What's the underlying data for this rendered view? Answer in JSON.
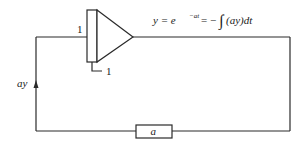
{
  "diagram": {
    "type": "analog-computer block diagram",
    "integrator": {
      "input_gain_label": "1",
      "initial_condition_label": "1"
    },
    "equation": {
      "lhs": "y = e",
      "exponent": "−at",
      "rhs_prefix": " = −",
      "integral_sign": "∫",
      "rhs_body": "(ay)dt"
    },
    "feedback_signal_label": "ay",
    "gain_block_label": "a",
    "colors": {
      "line": "#2a2a2a",
      "background": "#ffffff"
    }
  }
}
